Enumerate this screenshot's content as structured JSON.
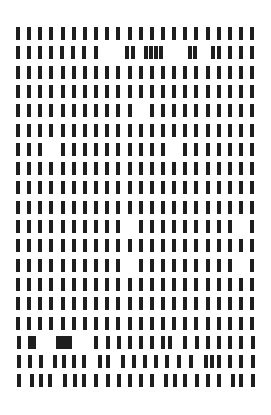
{
  "pattern": {
    "description": "Grid of black vertical bars",
    "bar_color": "#1e1e1e",
    "background": "#ffffff",
    "bar_width": 4,
    "bar_height": 13,
    "columns": 22,
    "column_x0": 16,
    "column_pitch": 11.15,
    "row_y0": 27,
    "row_pitch": 19.3,
    "rows": [
      {
        "missing": []
      },
      {
        "custom_x": [
          16,
          27,
          38,
          49,
          60,
          71,
          82,
          94,
          125,
          131,
          144,
          149,
          154,
          159,
          188,
          193,
          211,
          217,
          228,
          239,
          250
        ]
      },
      {
        "missing": []
      },
      {
        "missing": []
      },
      {
        "missing": [
          11
        ]
      },
      {
        "missing": []
      },
      {
        "missing": [
          3,
          14
        ]
      },
      {
        "missing": []
      },
      {
        "missing": []
      },
      {
        "missing": []
      },
      {
        "missing": [
          10,
          20
        ]
      },
      {
        "missing": []
      },
      {
        "missing": [
          10,
          20
        ]
      },
      {
        "missing": []
      },
      {
        "missing": []
      },
      {
        "missing": []
      },
      {
        "custom_x": [
          17,
          28,
          32,
          56,
          60,
          64,
          68,
          94,
          106,
          117,
          128,
          139,
          150,
          161,
          168,
          183,
          195,
          206,
          217,
          228,
          239,
          251
        ]
      },
      {
        "custom_x": [
          17,
          28,
          39,
          53,
          62,
          72,
          82,
          98,
          106,
          121,
          132,
          143,
          154,
          165,
          177,
          189,
          204,
          210,
          217,
          228,
          239,
          251
        ]
      },
      {
        "custom_x": [
          17,
          30,
          39,
          48,
          63,
          73,
          82,
          94,
          106,
          117,
          128,
          139,
          150,
          164,
          173,
          183,
          195,
          206,
          217,
          231,
          239,
          251
        ]
      }
    ]
  }
}
